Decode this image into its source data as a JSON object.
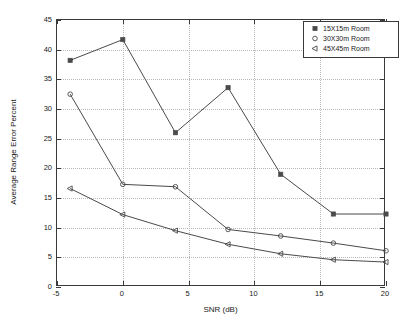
{
  "chart_data": {
    "type": "line",
    "title": "",
    "xlabel": "SNR (dB)",
    "ylabel": "Average Range Error Percent",
    "xlim": [
      -5,
      20
    ],
    "ylim": [
      0,
      45
    ],
    "xticks": [
      -5,
      0,
      5,
      10,
      15,
      20
    ],
    "yticks": [
      0,
      5,
      10,
      15,
      20,
      25,
      30,
      35,
      40,
      45
    ],
    "xticklabels": [
      "-5",
      "0",
      "5",
      "10",
      "15",
      "20"
    ],
    "yticklabels": [
      "0",
      "5",
      "10",
      "15",
      "20",
      "25",
      "30",
      "35",
      "40",
      "45"
    ],
    "grid": true,
    "grid_style": "dotted",
    "legend_position": "top-right",
    "x": [
      -4,
      0,
      4,
      8,
      12,
      16,
      20
    ],
    "series": [
      {
        "name": "15X15m Room",
        "marker": "filled-square",
        "color": "#4a4a4a",
        "values": [
          38.2,
          41.7,
          26.0,
          33.6,
          19.0,
          12.3,
          12.3
        ]
      },
      {
        "name": "30X30m Room",
        "marker": "open-circle",
        "color": "#4a4a4a",
        "values": [
          32.5,
          17.3,
          16.9,
          9.7,
          8.6,
          7.4,
          6.1
        ]
      },
      {
        "name": "45X45m Room",
        "marker": "left-triangle",
        "color": "#4a4a4a",
        "values": [
          16.6,
          12.2,
          9.5,
          7.2,
          5.6,
          4.6,
          4.2
        ]
      }
    ]
  },
  "legend": {
    "entries": [
      {
        "label": "15X15m Room",
        "marker": "filled-square"
      },
      {
        "label": "30X30m Room",
        "marker": "open-circle"
      },
      {
        "label": "45X45m Room",
        "marker": "left-triangle"
      }
    ]
  },
  "colors": {
    "axis": "#3a3a3a",
    "grid": "#b9b9b9",
    "line": "#4a4a4a",
    "background": "#ffffff",
    "text": "#1a1a1a"
  }
}
